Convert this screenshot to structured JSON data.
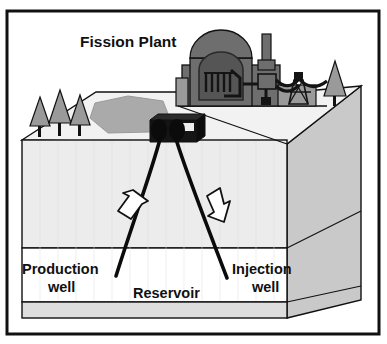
{
  "figure": {
    "name": "geothermal-fission-plant-cross-section",
    "title": "Fission Plant",
    "labels": {
      "production_well_line1": "Production",
      "production_well_line2": "well",
      "injection_well_line1": "Injection",
      "injection_well_line2": "well",
      "reservoir": "Reservoir"
    },
    "scene_elements": {
      "reactor_dome": "reactor-containment-dome",
      "reactor_core": "reactor-core-rods",
      "stack": "exhaust-stack",
      "turbine_hall": "turbine-generator-building",
      "transmission_tower": "transmission-tower",
      "power_lines": "power-lines",
      "trees": "conifer-trees",
      "lake": "surface-lake",
      "wellhead": "wellhead-equipment",
      "production_well_bore": "production-well-bore",
      "injection_well_bore": "injection-well-bore",
      "flow_arrow_up": "hot-fluid-up-arrow",
      "flow_arrow_down": "cold-fluid-down-arrow",
      "ground_block": "subsurface-block",
      "reservoir_layer": "reservoir-layer"
    },
    "colors": {
      "frame": "#111111",
      "background": "#ffffff",
      "ground_front": "#ececec",
      "ground_top": "#f2f2f2",
      "ground_side": "#c9c9c9",
      "reservoir_fill": "#ffffff",
      "basement_fill": "#dddddd",
      "lake": "#aaaaaa",
      "tree": "#9a9a9a",
      "plant_light": "#9a9a9a",
      "plant_mid": "#6e6e6e",
      "plant_dark": "#2a2a2a",
      "wellhead": "#151515",
      "arrow_fill": "#ffffff",
      "outline": "#111111"
    }
  }
}
